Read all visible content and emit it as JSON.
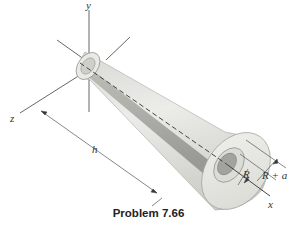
{
  "figure": {
    "caption": "Problem 7.66",
    "axes": {
      "x": "x",
      "y": "y",
      "z": "z"
    },
    "dimensions": {
      "length": "h",
      "inner_radius": "R",
      "outer_radius": "R + a"
    },
    "colors": {
      "surface_light": "#e6e6e2",
      "surface_mid": "#c9c9c4",
      "surface_dark": "#9a9a96",
      "line": "#444444"
    }
  }
}
